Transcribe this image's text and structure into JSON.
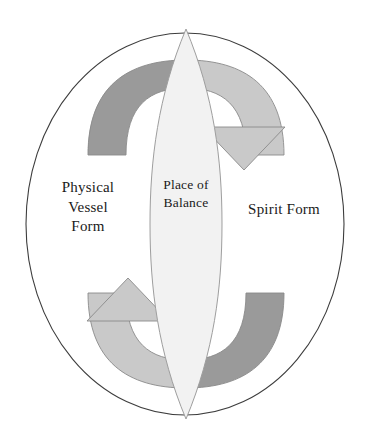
{
  "diagram": {
    "title": "Place of Balance",
    "type": "cyclical-balance-diagram",
    "labels": {
      "left": "Physical\nVessel\nForm",
      "center": "Place of\nBalance",
      "right": "Spirit Form"
    },
    "shapes": {
      "outer_ellipse": {
        "name": "outer-boundary-ellipse",
        "fill": "#ffffff",
        "stroke": "#3d3d3d"
      },
      "center_lens": {
        "name": "place-of-balance-lens",
        "fill": "#f2f2f2",
        "stroke": "#9e9e9e"
      },
      "arrow_top": {
        "name": "arrow-physical-to-spirit",
        "direction": "left-over-top-to-right",
        "band_color": "#9a9a9a",
        "head_color": "#c9c9c9",
        "stroke": "#8a8a8a"
      },
      "arrow_bottom": {
        "name": "arrow-spirit-to-physical",
        "direction": "right-under-bottom-to-left",
        "band_color": "#9a9a9a",
        "head_color": "#c9c9c9",
        "stroke": "#8a8a8a"
      }
    },
    "colors": {
      "background": "#ffffff",
      "outline": "#3d3d3d",
      "arrow_dark": "#9a9a9a",
      "arrow_light": "#c9c9c9",
      "lens_fill": "#f2f2f2",
      "text": "#1a1a1a"
    }
  }
}
